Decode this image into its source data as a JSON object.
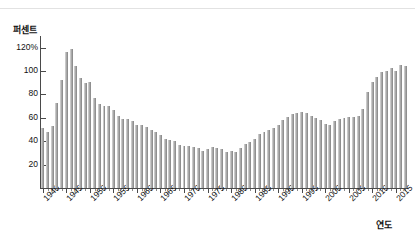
{
  "chart_data": {
    "type": "bar",
    "title": "",
    "subtitle": "",
    "xlabel": "연도",
    "ylabel": "퍼센트",
    "ylim": [
      0,
      130
    ],
    "xlim": [
      1939.4,
      2017.6
    ],
    "grid": false,
    "legend": null,
    "ytick_labels": [
      "120%",
      "100",
      "80",
      "60",
      "40",
      "20"
    ],
    "ytick_values": [
      120,
      100,
      80,
      60,
      40,
      20
    ],
    "xtick_labels": [
      "1940",
      "1945",
      "1950",
      "1955",
      "1960",
      "1965",
      "1970",
      "1975",
      "1980",
      "1985",
      "1990",
      "1995",
      "2000",
      "2005",
      "2010",
      "2015"
    ],
    "xtick_values": [
      1940,
      1945,
      1950,
      1955,
      1960,
      1965,
      1970,
      1975,
      1980,
      1985,
      1990,
      1995,
      2000,
      2005,
      2010,
      2015
    ],
    "bar_color": "#a9a9a9",
    "categories": [
      1940,
      1941,
      1942,
      1943,
      1944,
      1945,
      1946,
      1947,
      1948,
      1949,
      1950,
      1951,
      1952,
      1953,
      1954,
      1955,
      1956,
      1957,
      1958,
      1959,
      1960,
      1961,
      1962,
      1963,
      1964,
      1965,
      1966,
      1967,
      1968,
      1969,
      1970,
      1971,
      1972,
      1973,
      1974,
      1975,
      1976,
      1977,
      1978,
      1979,
      1980,
      1981,
      1982,
      1983,
      1984,
      1985,
      1986,
      1987,
      1988,
      1989,
      1990,
      1991,
      1992,
      1993,
      1994,
      1995,
      1996,
      1997,
      1998,
      1999,
      2000,
      2001,
      2002,
      2003,
      2004,
      2005,
      2006,
      2007,
      2008,
      2009,
      2010,
      2011,
      2012,
      2013,
      2014,
      2015,
      2016,
      2017
    ],
    "values": [
      51,
      48,
      53,
      73,
      92,
      116,
      119,
      104,
      94,
      90,
      91,
      77,
      72,
      70,
      70,
      67,
      62,
      59,
      59,
      57,
      54,
      54,
      52,
      50,
      48,
      45,
      42,
      41,
      40,
      37,
      36,
      36,
      35,
      34,
      32,
      33,
      35,
      34,
      33,
      31,
      32,
      31,
      34,
      38,
      39,
      42,
      46,
      48,
      50,
      51,
      54,
      58,
      61,
      63,
      64,
      65,
      64,
      62,
      60,
      58,
      55,
      54,
      57,
      59,
      60,
      61,
      61,
      62,
      68,
      82,
      91,
      95,
      99,
      100,
      103,
      100,
      105,
      104
    ]
  }
}
